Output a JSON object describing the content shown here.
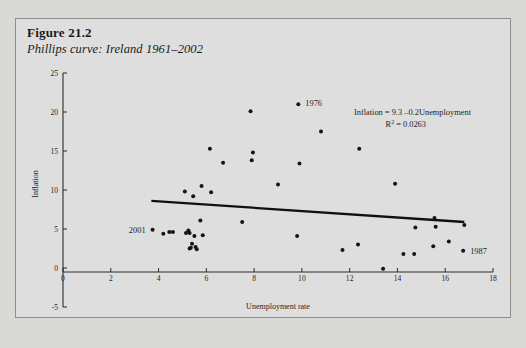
{
  "figure": {
    "number": "Figure 21.2",
    "title": "Phillips curve: Ireland 1961–2002"
  },
  "annotations": {
    "equation": "Inflation = 9.3 –0.2Unemployment",
    "r_squared_label": "R",
    "r_squared_exponent": "2",
    "r_squared_value": "= 0.0263",
    "r_squared_full": "R² = 0.0263"
  },
  "point_labels": [
    {
      "text": "2001",
      "x": 3.75,
      "y": 4.9,
      "anchor": "end",
      "dx": -7,
      "dy": 3
    },
    {
      "text": "1976",
      "x": 9.85,
      "y": 21.0,
      "anchor": "start",
      "dx": 7,
      "dy": 2
    },
    {
      "text": "1987",
      "x": 16.75,
      "y": 2.2,
      "anchor": "start",
      "dx": 7,
      "dy": 3
    }
  ],
  "chart_data": {
    "type": "scatter",
    "title": "Phillips curve: Ireland 1961–2002",
    "xlabel": "Unemployment rate",
    "ylabel": "Inflation",
    "xlim": [
      0,
      18
    ],
    "ylim": [
      -5,
      25
    ],
    "xticks": [
      0,
      2,
      4,
      6,
      8,
      10,
      12,
      14,
      16,
      18
    ],
    "xticklabels": [
      "0",
      "2",
      "4",
      "6",
      "8",
      "10",
      "12",
      "14",
      "16",
      "18"
    ],
    "yticks": [
      -5,
      0,
      5,
      10,
      15,
      20,
      25
    ],
    "yticklabels": [
      "-5",
      "0",
      "5",
      "10",
      "15",
      "20",
      "25"
    ],
    "grid": false,
    "legend": null,
    "series": [
      {
        "name": "Ireland annual observations 1961–2002",
        "marker": "dot",
        "color": "#141414",
        "points": [
          [
            3.75,
            4.9
          ],
          [
            4.2,
            4.4
          ],
          [
            4.45,
            4.6
          ],
          [
            4.6,
            4.6
          ],
          [
            5.1,
            9.8
          ],
          [
            5.15,
            4.5
          ],
          [
            5.25,
            4.8
          ],
          [
            5.3,
            4.5
          ],
          [
            5.3,
            2.5
          ],
          [
            5.35,
            2.6
          ],
          [
            5.4,
            3.1
          ],
          [
            5.45,
            9.2
          ],
          [
            5.5,
            4.1
          ],
          [
            5.55,
            2.7
          ],
          [
            5.6,
            2.4
          ],
          [
            5.75,
            6.1
          ],
          [
            5.8,
            10.5
          ],
          [
            5.85,
            4.2
          ],
          [
            6.15,
            15.3
          ],
          [
            6.2,
            9.7
          ],
          [
            6.7,
            13.5
          ],
          [
            7.5,
            5.9
          ],
          [
            7.85,
            20.1
          ],
          [
            7.9,
            13.8
          ],
          [
            7.95,
            14.8
          ],
          [
            9.0,
            10.7
          ],
          [
            9.8,
            4.1
          ],
          [
            9.85,
            21.0
          ],
          [
            9.9,
            13.4
          ],
          [
            10.8,
            17.5
          ],
          [
            11.7,
            2.3
          ],
          [
            12.35,
            3.0
          ],
          [
            12.4,
            15.3
          ],
          [
            13.4,
            -0.1
          ],
          [
            13.9,
            10.8
          ],
          [
            14.25,
            1.8
          ],
          [
            14.7,
            1.8
          ],
          [
            14.75,
            5.2
          ],
          [
            15.5,
            2.8
          ],
          [
            15.55,
            6.4
          ],
          [
            15.6,
            5.3
          ],
          [
            16.15,
            3.4
          ],
          [
            16.75,
            2.2
          ],
          [
            16.8,
            5.5
          ]
        ]
      }
    ],
    "fit_line": {
      "name": "OLS regression line",
      "equation": "Inflation = 9.3 – 0.2 × Unemployment",
      "intercept": 9.3,
      "slope": -0.2,
      "r_squared": 0.0263,
      "x_start": 3.7,
      "x_end": 16.8,
      "y_start": 8.6,
      "y_end": 5.9
    }
  }
}
